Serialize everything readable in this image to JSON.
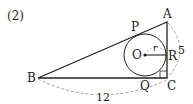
{
  "problem_label": "(2)",
  "points": {
    "A": "A",
    "B": "B",
    "C": "C",
    "O": "O",
    "P": "P",
    "Q": "Q",
    "R": "R"
  },
  "dimensions": {
    "BC": "12",
    "AC": "5",
    "radius": "r"
  },
  "colors": {
    "line": "#222222",
    "dashed": "#888888",
    "background": "#ffffff"
  }
}
